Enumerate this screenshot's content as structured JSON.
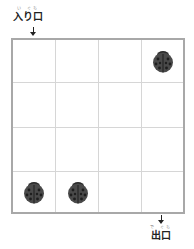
{
  "entrance": {
    "label": "入り口",
    "ruby": "い ぐち"
  },
  "exit": {
    "label": "出口",
    "ruby": "で ぐち"
  },
  "grid": {
    "rows": 4,
    "cols": 4,
    "border_color": "#a8a8a8",
    "line_color": "#d6d6d6"
  },
  "ladybugs": [
    {
      "row": 0,
      "col": 3,
      "icon": "ladybug-icon"
    },
    {
      "row": 3,
      "col": 0,
      "icon": "ladybug-icon"
    },
    {
      "row": 3,
      "col": 1,
      "icon": "ladybug-icon"
    }
  ],
  "colors": {
    "ladybug_body": "#4a4a4a",
    "ladybug_head": "#2a2a2a",
    "ladybug_spots": "#1e1e1e"
  }
}
